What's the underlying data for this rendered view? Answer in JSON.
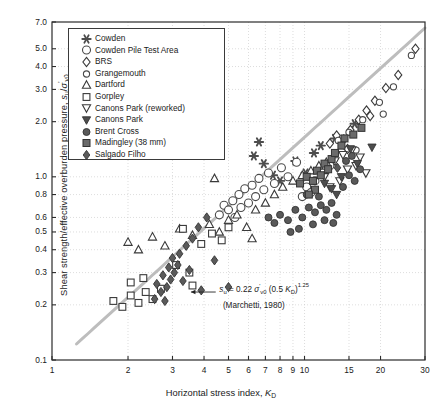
{
  "chart_data": {
    "type": "scatter",
    "title": "",
    "xlabel": "Horizontal stress index, K_D",
    "ylabel": "Shear strength/effective overburden pressure, s_u/sigma'_v0",
    "xscale": "log",
    "yscale": "log",
    "xlim": [
      1,
      30
    ],
    "ylim": [
      0.1,
      7.0
    ],
    "grid": true,
    "legend_position": "upper-left-inset",
    "xticks": [
      1,
      2,
      3,
      4,
      5,
      6,
      7,
      8,
      9,
      10,
      15,
      20,
      30
    ],
    "xticklabels": [
      "1",
      "2",
      "3",
      "4",
      "5",
      "6",
      "7",
      "8",
      "9",
      "10",
      "15",
      "20",
      "30"
    ],
    "yticks": [
      0.1,
      0.2,
      0.3,
      0.4,
      0.5,
      0.6,
      0.8,
      1.0,
      2.0,
      3.0,
      4.0,
      5.0,
      7.0
    ],
    "yticklabels": [
      "0.1",
      "0.2",
      "0.3",
      "0.4",
      "0.5",
      "0.6",
      "0.8",
      "1.0",
      "2.0",
      "3.0",
      "4.0",
      "5.0",
      "7.0"
    ],
    "annotation": {
      "equation": "s_u = 0.22 sigma'_v0 (0.5 K_D)^1.25",
      "citation": "(Marchetti, 1980)",
      "arrow": true
    },
    "trendline": {
      "label": "Marchetti (1980) correlation",
      "color": "#bdbdbd",
      "width": 3,
      "formula": "su/sv0 = 0.22*(0.5*KD)^1.25",
      "x_from": 1.25,
      "x_to": 30
    },
    "series": [
      {
        "name": "Cowden",
        "marker": "asterisk",
        "fill": "#4d4d4d",
        "edge": "#333333",
        "points": [
          [
            6.3,
            1.3
          ],
          [
            6.6,
            1.55
          ],
          [
            6.9,
            1.18
          ],
          [
            7.5,
            1.02
          ],
          [
            8.0,
            0.95
          ],
          [
            9.2,
            1.22
          ],
          [
            10.1,
            1.05
          ],
          [
            10.9,
            1.35
          ],
          [
            11.6,
            1.48
          ],
          [
            13.2,
            1.62
          ],
          [
            15.8,
            1.95
          ]
        ]
      },
      {
        "name": "Cowden Pile Test Area",
        "marker": "circle-large-open",
        "fill": "none",
        "edge": "#4a4a4a",
        "points": [
          [
            4.6,
            0.62
          ],
          [
            4.8,
            0.7
          ],
          [
            5.0,
            0.66
          ],
          [
            5.2,
            0.74
          ],
          [
            5.3,
            0.6
          ],
          [
            5.5,
            0.8
          ],
          [
            5.6,
            0.68
          ],
          [
            5.8,
            0.86
          ],
          [
            6.0,
            0.72
          ],
          [
            6.2,
            0.9
          ],
          [
            6.4,
            0.78
          ],
          [
            6.6,
            0.98
          ],
          [
            6.9,
            0.85
          ],
          [
            7.2,
            1.05
          ],
          [
            7.6,
            0.92
          ],
          [
            8.1,
            1.12
          ],
          [
            8.6,
            1.0
          ],
          [
            9.3,
            1.2
          ],
          [
            10.2,
            0.88
          ],
          [
            11.0,
            0.95
          ],
          [
            11.8,
            1.05
          ],
          [
            12.6,
            1.15
          ],
          [
            9.8,
            0.78
          ],
          [
            10.6,
            0.82
          ]
        ]
      },
      {
        "name": "BRS",
        "marker": "diamond-open",
        "fill": "none",
        "edge": "#3a3a3a",
        "points": [
          [
            12.6,
            1.52
          ],
          [
            13.4,
            1.68
          ],
          [
            14.3,
            1.6
          ],
          [
            15.2,
            1.8
          ],
          [
            16.4,
            2.05
          ],
          [
            17.6,
            2.3
          ],
          [
            19.0,
            2.6
          ],
          [
            21.0,
            3.05
          ],
          [
            23.5,
            3.6
          ],
          [
            27.5,
            5.0
          ],
          [
            14.8,
            1.42
          ],
          [
            18.2,
            2.15
          ]
        ]
      },
      {
        "name": "Grangemouth",
        "marker": "circle-small-open",
        "fill": "none",
        "edge": "#4a4a4a",
        "points": [
          [
            13.6,
            1.58
          ],
          [
            15.0,
            1.75
          ],
          [
            17.0,
            2.05
          ],
          [
            19.8,
            2.55
          ],
          [
            22.5,
            3.1
          ],
          [
            26.5,
            4.6
          ],
          [
            16.0,
            1.4
          ],
          [
            20.5,
            2.2
          ]
        ]
      },
      {
        "name": "Dartford",
        "marker": "triangle-up-open",
        "fill": "none",
        "edge": "#3a3a3a",
        "points": [
          [
            2.0,
            0.44
          ],
          [
            2.2,
            0.4
          ],
          [
            2.5,
            0.47
          ],
          [
            2.8,
            0.42
          ],
          [
            3.2,
            0.52
          ],
          [
            3.6,
            0.48
          ],
          [
            4.2,
            0.55
          ],
          [
            4.6,
            0.5
          ],
          [
            5.0,
            0.58
          ],
          [
            5.4,
            0.62
          ],
          [
            5.9,
            0.53
          ],
          [
            6.4,
            0.66
          ],
          [
            7.0,
            0.72
          ],
          [
            7.6,
            0.8
          ],
          [
            8.2,
            0.88
          ],
          [
            4.4,
            0.98
          ],
          [
            6.2,
            0.46
          ],
          [
            9.0,
            0.95
          ],
          [
            9.8,
            1.02
          ],
          [
            10.6,
            1.08
          ],
          [
            11.4,
            1.15
          ],
          [
            12.2,
            1.2
          ]
        ]
      },
      {
        "name": "Gorpley",
        "marker": "square-open",
        "fill": "none",
        "edge": "#3a3a3a",
        "points": [
          [
            1.75,
            0.21
          ],
          [
            1.9,
            0.195
          ],
          [
            2.05,
            0.225
          ],
          [
            2.2,
            0.205
          ],
          [
            2.35,
            0.235
          ],
          [
            2.5,
            0.215
          ],
          [
            2.7,
            0.245
          ],
          [
            2.05,
            0.265
          ],
          [
            2.3,
            0.28
          ],
          [
            3.1,
            0.33
          ],
          [
            3.5,
            0.3
          ],
          [
            3.9,
            0.43
          ],
          [
            4.3,
            0.49
          ],
          [
            4.7,
            0.45
          ],
          [
            3.3,
            0.52
          ],
          [
            5.0,
            0.53
          ],
          [
            3.6,
            0.255
          ]
        ]
      },
      {
        "name": "Canons Park (reworked)",
        "marker": "triangle-down-open",
        "fill": "none",
        "edge": "#3a3a3a",
        "points": [
          [
            13.2,
            1.22
          ],
          [
            14.2,
            1.32
          ],
          [
            15.4,
            1.4
          ],
          [
            16.6,
            1.28
          ],
          [
            14.8,
            1.1
          ],
          [
            16.0,
            1.15
          ],
          [
            12.6,
            0.88
          ],
          [
            13.8,
            0.95
          ],
          [
            17.5,
            1.05
          ],
          [
            12.0,
            1.0
          ]
        ]
      },
      {
        "name": "Canons Park",
        "marker": "triangle-down-filled",
        "fill": "#4d4d4d",
        "edge": "#333333",
        "points": [
          [
            12.0,
            0.92
          ],
          [
            12.8,
            0.86
          ],
          [
            14.0,
            1.0
          ],
          [
            15.2,
            1.42
          ],
          [
            18.5,
            1.45
          ],
          [
            13.4,
            0.8
          ],
          [
            16.2,
            1.18
          ]
        ]
      },
      {
        "name": "Brent Cross",
        "marker": "circle-filled",
        "fill": "#595959",
        "edge": "#333333",
        "points": [
          [
            8.0,
            0.62
          ],
          [
            8.6,
            0.58
          ],
          [
            9.2,
            0.66
          ],
          [
            9.8,
            0.6
          ],
          [
            10.4,
            0.68
          ],
          [
            11.0,
            0.64
          ],
          [
            11.6,
            0.7
          ],
          [
            12.2,
            0.66
          ],
          [
            12.8,
            0.72
          ],
          [
            13.4,
            0.62
          ],
          [
            9.5,
            0.52
          ],
          [
            10.8,
            0.55
          ],
          [
            8.8,
            0.5
          ],
          [
            12.0,
            0.58
          ],
          [
            13.0,
            0.56
          ],
          [
            11.4,
            0.78
          ],
          [
            10.2,
            0.8
          ],
          [
            14.2,
            0.88
          ],
          [
            15.0,
            1.02
          ],
          [
            15.8,
            0.95
          ],
          [
            16.6,
            1.1
          ],
          [
            14.6,
            1.22
          ],
          [
            15.4,
            1.3
          ],
          [
            7.6,
            0.56
          ],
          [
            7.2,
            0.6
          ]
        ]
      },
      {
        "name": "Madingley (38 mm)",
        "marker": "square-filled",
        "fill": "#6b6b6b",
        "edge": "#333333",
        "points": [
          [
            9.6,
            0.92
          ],
          [
            10.2,
            1.0
          ],
          [
            10.8,
            0.95
          ],
          [
            11.2,
            1.08
          ],
          [
            11.6,
            1.02
          ],
          [
            12.0,
            1.18
          ],
          [
            12.4,
            1.1
          ],
          [
            12.8,
            1.25
          ],
          [
            11.0,
            0.85
          ],
          [
            10.4,
            0.8
          ],
          [
            13.2,
            1.35
          ],
          [
            14.4,
            1.62
          ],
          [
            15.6,
            1.7
          ],
          [
            16.8,
            1.85
          ],
          [
            14.0,
            1.48
          ]
        ]
      },
      {
        "name": "Salgado Filho",
        "marker": "diamond-filled",
        "fill": "#5a5a5a",
        "edge": "#333333",
        "points": [
          [
            2.55,
            0.215
          ],
          [
            2.7,
            0.235
          ],
          [
            2.85,
            0.25
          ],
          [
            2.95,
            0.275
          ],
          [
            3.05,
            0.3
          ],
          [
            3.15,
            0.33
          ],
          [
            2.75,
            0.29
          ],
          [
            2.9,
            0.32
          ],
          [
            3.0,
            0.36
          ],
          [
            3.2,
            0.38
          ],
          [
            3.4,
            0.42
          ],
          [
            3.6,
            0.46
          ],
          [
            3.3,
            0.27
          ],
          [
            3.5,
            0.31
          ],
          [
            3.8,
            0.53
          ],
          [
            4.1,
            0.6
          ],
          [
            4.4,
            0.35
          ],
          [
            2.6,
            0.26
          ],
          [
            2.8,
            0.21
          ],
          [
            3.9,
            0.24
          ],
          [
            13.5,
            1.12
          ],
          [
            5.0,
            0.25
          ]
        ]
      }
    ]
  },
  "axes": {
    "ylabel_parts": {
      "pre": "Shear strength/effective overburden pressure, ",
      "s": "s",
      "sub1": "u",
      "slash": "/",
      "sigma": "σ",
      "prime": "'",
      "sub2": "v0"
    },
    "xlabel_parts": {
      "pre": "Horizontal stress index, ",
      "k": "K",
      "sub": "D"
    }
  },
  "annotation_parts": {
    "s": "s",
    "s_sub": "u",
    "eq": " = 0.22 ",
    "sigma": "σ",
    "prime": "'",
    "sig_sub": "v0",
    "paren": " (0.5 ",
    "k": "K",
    "k_sub": "D",
    "close": ")",
    "exp": "1.25",
    "citation": "(Marchetti, 1980)"
  }
}
